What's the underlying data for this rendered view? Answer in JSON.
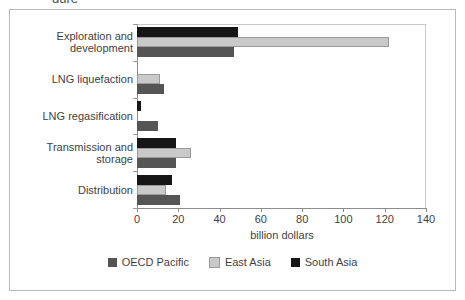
{
  "figure": {
    "title_fragment": "gure",
    "xlabel": "billion dollars"
  },
  "chart_data": {
    "type": "bar",
    "orientation": "horizontal",
    "title": "",
    "xlabel": "billion dollars",
    "ylabel": "",
    "xlim": [
      0,
      140
    ],
    "xticks": [
      "0",
      "20",
      "40",
      "60",
      "80",
      "100",
      "120",
      "140"
    ],
    "xtick_values": [
      0,
      20,
      40,
      60,
      80,
      100,
      120,
      140
    ],
    "grid": false,
    "legend_position": "bottom",
    "categories": [
      "Exploration and development",
      "LNG liquefaction",
      "LNG regasification",
      "Transmission and storage",
      "Distribution"
    ],
    "series": [
      {
        "name": "South Asia",
        "color": "#161616",
        "values": [
          49,
          0,
          2,
          19,
          17
        ]
      },
      {
        "name": "East Asia",
        "color": "#c9c9c9",
        "values": [
          122,
          11,
          0,
          26,
          14
        ]
      },
      {
        "name": "OECD Pacific",
        "color": "#555555",
        "values": [
          47,
          13,
          10,
          19,
          21
        ]
      }
    ]
  },
  "legend": [
    {
      "label": "OECD Pacific",
      "color": "#555555"
    },
    {
      "label": "East Asia",
      "color": "#c9c9c9"
    },
    {
      "label": "South Asia",
      "color": "#161616"
    }
  ],
  "categories": [
    {
      "line1": "Exploration and",
      "line2": "development"
    },
    {
      "line1": "LNG liquefaction",
      "line2": ""
    },
    {
      "line1": "LNG regasification",
      "line2": ""
    },
    {
      "line1": "Transmission and",
      "line2": "storage"
    },
    {
      "line1": "Distribution",
      "line2": ""
    }
  ]
}
